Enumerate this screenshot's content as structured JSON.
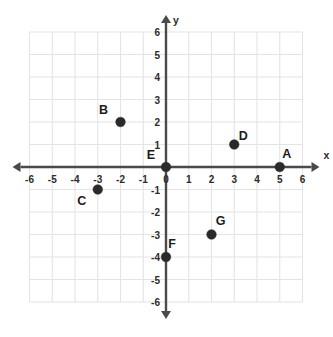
{
  "chart_data": {
    "type": "scatter",
    "title": "",
    "xlabel": "x",
    "ylabel": "y",
    "xlim": [
      -6,
      6
    ],
    "ylim": [
      -6,
      6
    ],
    "grid": true,
    "legend": "none",
    "x_ticks": [
      -6,
      -5,
      -4,
      -3,
      -2,
      -1,
      0,
      1,
      2,
      3,
      4,
      5,
      6
    ],
    "y_ticks": [
      -6,
      -5,
      -4,
      -3,
      -2,
      -1,
      1,
      2,
      3,
      4,
      5,
      6
    ],
    "x_tick_labels": [
      "-6",
      "-5",
      "-4",
      "-3",
      "-2",
      "-1",
      "0",
      "1",
      "2",
      "3",
      "4",
      "5",
      "6"
    ],
    "y_tick_labels": [
      "-6",
      "-5",
      "-4",
      "-3",
      "-2",
      "-1",
      "1",
      "2",
      "3",
      "4",
      "5",
      "6"
    ],
    "points": [
      {
        "label": "A",
        "x": 5,
        "y": 0,
        "label_dx": 7,
        "label_dy": -9
      },
      {
        "label": "B",
        "x": -2,
        "y": 2,
        "label_dx": -17,
        "label_dy": -8
      },
      {
        "label": "C",
        "x": -3,
        "y": -1,
        "label_dx": -16,
        "label_dy": 15
      },
      {
        "label": "D",
        "x": 3,
        "y": 1,
        "label_dx": 9,
        "label_dy": -5
      },
      {
        "label": "E",
        "x": 0,
        "y": 0,
        "label_dx": -15,
        "label_dy": -8
      },
      {
        "label": "F",
        "x": 0,
        "y": -4,
        "label_dx": 6,
        "label_dy": -9
      },
      {
        "label": "G",
        "x": 2,
        "y": -3,
        "label_dx": 9,
        "label_dy": -10
      }
    ]
  },
  "axis_names": {
    "x": "x",
    "y": "y"
  }
}
